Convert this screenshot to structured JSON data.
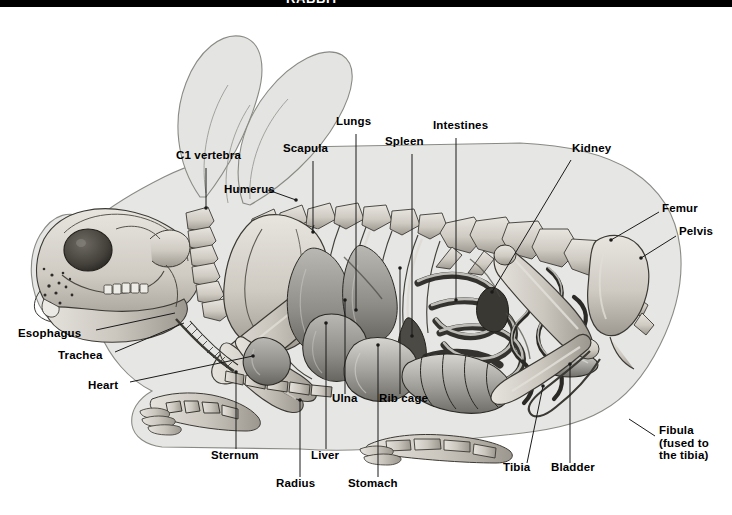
{
  "figure": {
    "type": "anatomical-illustration",
    "header_caption": "RABBIT",
    "background_color": "#ffffff",
    "ink_color": "#000000",
    "body_silhouette_color": "#e3e3e3",
    "bone_fill_color": "#cfcbc4",
    "organ_fill_color": "#9a9a95",
    "leader_line_color": "#1a1a1a"
  },
  "labels": [
    {
      "id": "c1-vertebra",
      "text": "C1 vertebra",
      "x": 176,
      "y": 155,
      "anchor": "left",
      "lines": [
        "C1 vertebra"
      ]
    },
    {
      "id": "humerus",
      "text": "Humerus",
      "x": 224,
      "y": 189,
      "anchor": "left",
      "lines": [
        "Humerus"
      ]
    },
    {
      "id": "scapula",
      "text": "Scapula",
      "x": 283,
      "y": 148,
      "anchor": "left",
      "lines": [
        "Scapula"
      ]
    },
    {
      "id": "lungs",
      "text": "Lungs",
      "x": 336,
      "y": 121,
      "anchor": "left",
      "lines": [
        "Lungs"
      ]
    },
    {
      "id": "spleen",
      "text": "Spleen",
      "x": 385,
      "y": 141,
      "anchor": "left",
      "lines": [
        "Spleen"
      ]
    },
    {
      "id": "intestines",
      "text": "Intestines",
      "x": 433,
      "y": 125,
      "anchor": "left",
      "lines": [
        "Intestines"
      ]
    },
    {
      "id": "kidney",
      "text": "Kidney",
      "x": 572,
      "y": 148,
      "anchor": "left",
      "lines": [
        "Kidney"
      ]
    },
    {
      "id": "femur",
      "text": "Femur",
      "x": 662,
      "y": 208,
      "anchor": "left",
      "lines": [
        "Femur"
      ]
    },
    {
      "id": "pelvis",
      "text": "Pelvis",
      "x": 679,
      "y": 231,
      "anchor": "left",
      "lines": [
        "Pelvis"
      ]
    },
    {
      "id": "esophagus",
      "text": "Esophagus",
      "x": 18,
      "y": 333,
      "anchor": "left",
      "lines": [
        "Esophagus"
      ]
    },
    {
      "id": "trachea",
      "text": "Trachea",
      "x": 58,
      "y": 355,
      "anchor": "left",
      "lines": [
        "Trachea"
      ]
    },
    {
      "id": "heart",
      "text": "Heart",
      "x": 88,
      "y": 385,
      "anchor": "left",
      "lines": [
        "Heart"
      ]
    },
    {
      "id": "sternum",
      "text": "Sternum",
      "x": 211,
      "y": 455,
      "anchor": "left",
      "lines": [
        "Sternum"
      ]
    },
    {
      "id": "radius",
      "text": "Radius",
      "x": 276,
      "y": 483,
      "anchor": "left",
      "lines": [
        "Radius"
      ]
    },
    {
      "id": "liver",
      "text": "Liver",
      "x": 311,
      "y": 455,
      "anchor": "left",
      "lines": [
        "Liver"
      ]
    },
    {
      "id": "stomach",
      "text": "Stomach",
      "x": 348,
      "y": 483,
      "anchor": "left",
      "lines": [
        "Stomach"
      ]
    },
    {
      "id": "ulna",
      "text": "Ulna",
      "x": 332,
      "y": 398,
      "anchor": "left",
      "lines": [
        "Ulna"
      ]
    },
    {
      "id": "rib-cage",
      "text": "Rib cage",
      "x": 379,
      "y": 398,
      "anchor": "left",
      "lines": [
        "Rib cage"
      ]
    },
    {
      "id": "tibia",
      "text": "Tibia",
      "x": 503,
      "y": 467,
      "anchor": "left",
      "lines": [
        "Tibia"
      ]
    },
    {
      "id": "bladder",
      "text": "Bladder",
      "x": 551,
      "y": 467,
      "anchor": "left",
      "lines": [
        "Bladder"
      ]
    },
    {
      "id": "fibula",
      "text": "Fibula (fused to the tibia)",
      "x": 659,
      "y": 430,
      "anchor": "left",
      "lines": [
        "Fibula",
        "(fused to",
        "the tibia)"
      ]
    }
  ],
  "leader_lines": [
    {
      "for": "c1-vertebra",
      "points": "206,168 206,208"
    },
    {
      "for": "humerus",
      "points": "268,190 296,200"
    },
    {
      "for": "scapula",
      "points": "313,161 313,232"
    },
    {
      "for": "lungs",
      "points": "356,134 356,310"
    },
    {
      "for": "spleen",
      "points": "412,154 412,336"
    },
    {
      "for": "intestines",
      "points": "456,138 456,300"
    },
    {
      "for": "kidney",
      "points": "571,160 492,292"
    },
    {
      "for": "femur",
      "points": "659,212 611,240"
    },
    {
      "for": "pelvis",
      "points": "676,236 641,258"
    },
    {
      "for": "esophagus",
      "points": "96,330 175,313"
    },
    {
      "for": "trachea",
      "points": "115,352 184,323"
    },
    {
      "for": "heart",
      "points": "130,382 253,356"
    },
    {
      "for": "sternum",
      "points": "236,449 236,372"
    },
    {
      "for": "radius",
      "points": "300,477 300,400"
    },
    {
      "for": "liver",
      "points": "326,449 326,323"
    },
    {
      "for": "stomach",
      "points": "378,477 378,345"
    },
    {
      "for": "ulna",
      "points": "345,394 345,300"
    },
    {
      "for": "rib-cage",
      "points": "400,394 400,268"
    },
    {
      "for": "tibia",
      "points": "527,463 543,386"
    },
    {
      "for": "bladder",
      "points": "570,463 570,364"
    },
    {
      "for": "fibula",
      "points": "655,436 629,419"
    }
  ],
  "anatomy_parts": [
    "left ear",
    "right ear",
    "skull",
    "eye socket",
    "incisors",
    "molars",
    "mandible",
    "cervical vertebrae",
    "thoracic vertebrae",
    "lumbar vertebrae",
    "sacrum",
    "tail vertebrae",
    "scapula",
    "humerus",
    "radius",
    "ulna",
    "carpals",
    "front paw phalanges",
    "ribs",
    "sternum",
    "trachea",
    "esophagus",
    "heart",
    "lungs",
    "liver",
    "stomach",
    "spleen",
    "small intestine",
    "large intestine",
    "cecum",
    "kidney",
    "bladder",
    "pelvis",
    "femur",
    "tibia",
    "fibula",
    "hind paw phalanges"
  ]
}
